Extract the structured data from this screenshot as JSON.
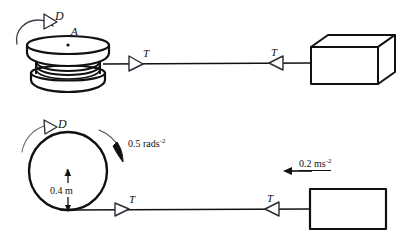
{
  "figure": {
    "background_color": "#ffffff",
    "ink_color": "#111111"
  },
  "upper_diagram": {
    "name": "perspective-view",
    "spool": {
      "label": "A",
      "centre_dot": true,
      "coil_count": 3
    },
    "rotation_arrow_label": "D",
    "tension_left_label": "T",
    "tension_right_label": "T",
    "block": {
      "shape": "isometric-box"
    }
  },
  "lower_diagram": {
    "name": "side-view",
    "wheel": {
      "centre_label": "A",
      "radius_label": "0.4 m"
    },
    "rotation_arrow_label": "D",
    "angular_acceleration_label": "0.5 rads",
    "angular_acceleration_exponent": "-2",
    "linear_acceleration_label": "0.2 ms",
    "linear_acceleration_exponent": "-2",
    "tension_left_label": "T",
    "tension_right_label": "T",
    "block": {
      "shape": "rectangle"
    }
  }
}
